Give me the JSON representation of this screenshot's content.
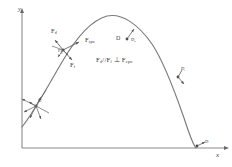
{
  "figure": {
    "type": "physics-trajectory-diagram",
    "background_color": "#ffffff",
    "ink_color": "#555555",
    "axes": {
      "x_label": "x",
      "y_label": "y",
      "origin_px": [
        22,
        148
      ],
      "x_end_px": [
        228,
        148
      ],
      "y_end_px": [
        22,
        10
      ]
    },
    "curve": {
      "description": "ballistic trajectory arc",
      "color": "#6e6e6e",
      "peak_px": [
        107,
        16
      ],
      "start_px": [
        22,
        126
      ],
      "end_px": [
        196,
        148
      ]
    },
    "equation": "F_d // F_l ⊥ F_cpn",
    "equation_parts": {
      "first": "F",
      "first_sub": "d",
      "parallel": "//",
      "second": "F",
      "second_sub": "l",
      "perp": "⊥",
      "third": "F",
      "third_sub": "cpn"
    },
    "force_labels": [
      {
        "name": "drag-force",
        "base": "F",
        "sub": "d",
        "x": 55,
        "y": 33
      },
      {
        "name": "centripetal-force",
        "base": "F",
        "sub": "cpn",
        "x": 84,
        "y": 40
      },
      {
        "name": "friction-force",
        "base": "F",
        "sub": "f",
        "x": 68,
        "y": 63
      },
      {
        "name": "gravity-force",
        "base": "F",
        "sub": "g",
        "x": 58,
        "y": 51
      }
    ],
    "point_labels": [
      {
        "name": "upper-right-D",
        "base": "D",
        "sub": "",
        "x": 120,
        "y": 38
      },
      {
        "name": "upper-right-D-sub",
        "base": "D",
        "sub": "b",
        "x": 130,
        "y": 40
      },
      {
        "name": "mid-right-D",
        "base": "D",
        "sub": "i",
        "x": 180,
        "y": 70
      },
      {
        "name": "mid-right-D-v",
        "base": "",
        "sub": "v",
        "x": 181,
        "y": 79
      },
      {
        "name": "lower-right-D",
        "base": "D",
        "sub": "",
        "x": 206,
        "y": 143
      },
      {
        "name": "lower-left-cluster",
        "base": "D",
        "sub": "",
        "x": 36,
        "y": 101
      }
    ],
    "annotations": {
      "origin_cluster_note": "multiple force arrows converging at a point on the ascending branch near the y-axis"
    }
  }
}
